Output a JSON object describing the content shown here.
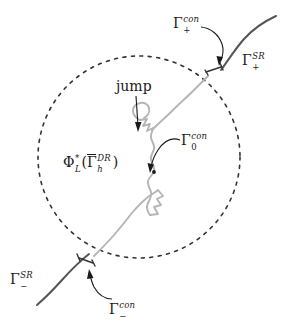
{
  "figure": {
    "kind": "mathematical-diagram",
    "width": 294,
    "height": 326,
    "background_color": "#ffffff"
  },
  "colors": {
    "ink": "#1a1a1a",
    "dashed_circle": "#333333",
    "rough_curve": "#b5b5b5",
    "smooth_curve": "#555555",
    "bracket": "#333333"
  },
  "labels": {
    "jump": {
      "text": "jump",
      "name": "jump-label"
    },
    "phi": {
      "base": "Φ",
      "sup": "*",
      "sub": "L",
      "open_paren": "(",
      "gamma_bar": "Γ",
      "gamma_sup": "DR",
      "gamma_sub": "h",
      "close_paren": ")",
      "plain": "Φ*_L(Γ̄^DR_h)"
    },
    "gamma_0_con": {
      "base": "Γ",
      "sup": "con",
      "sub": "0",
      "plain": "Γ_0^con"
    },
    "gamma_plus_con": {
      "base": "Γ",
      "sup": "con",
      "sub": "+",
      "plain": "Γ_+^con"
    },
    "gamma_plus_sr": {
      "base": "Γ",
      "sup": "SR",
      "sub": "+",
      "plain": "Γ_+^SR"
    },
    "gamma_minus_sr": {
      "base": "Γ",
      "sup": "SR",
      "sub": "−",
      "plain": "Γ_-^SR"
    },
    "gamma_minus_con": {
      "base": "Γ",
      "sup": "con",
      "sub": "−",
      "plain": "Γ_-^con"
    }
  },
  "geometry": {
    "circle": {
      "cx": 139,
      "cy": 157,
      "r": 101,
      "dash": "3 5"
    },
    "rough_curve_path": "M 96,258 C 104,250 112,243 118,235 C 124,228 129,221 134,214 C 140,206 145,200 150,196 C 154,193 157,191 158,189 C 159,187 157,186 155,186 C 152,186 150,187 150,189 C 150,192 152,194 155,195 C 158,196 160,195 161,192 C 162,188 160,184 157,181 C 154,178 152,175 152,172 C 152,169 154,166 156,164 C 158,162 159,160 158,158 C 157,156 154,155 152,156 C 150,157 149,159 150,161 C 151,163 153,164 155,163 C 158,162 159,159 158,156 C 156,152 153,149 151,146 C 149,143 148,140 149,137 C 150,134 152,131 153,129 C 154,127 153,125 151,124 C 148,123 145,124 144,127 C 143,130 145,133 148,134 C 151,135 154,133 155,130 C 156,126 154,122 151,119 C 148,116 146,113 147,110 C 148,107 150,105 152,104 C 154,103 155,101 154,99 C 153,97 150,96 147,97 C 144,98 142,101 143,104 C 144,107 147,108 150,107 C 152,106 153,104 152,102",
    "rough_curve_upper_path": "M 156,127 C 162,121 168,116 174,110 C 180,104 186,99 192,94 C 197,89 202,85 206,81 C 209,78 212,75 214,73",
    "smooth_curve_plus_path": "M 220,70 C 228,60 236,50 244,41 C 252,32 262,25 275,18",
    "smooth_curve_minus_path": "M 90,255 C 80,262 70,270 60,280 C 50,290 42,298 34,306",
    "bracket_plus": {
      "x1": 207,
      "y1": 72,
      "x2": 222,
      "y2": 66
    },
    "bracket_minus": {
      "x1": 78,
      "y1": 258,
      "x2": 93,
      "y2": 264
    },
    "dot_gamma0": {
      "cx": 154,
      "cy": 172,
      "r": 1.8
    },
    "arrow_jump": {
      "x1": 136,
      "y1": 96,
      "x2": 139,
      "y2": 128
    },
    "arrow_gamma0": {
      "from": [
        180,
        141
      ],
      "to": [
        157,
        169
      ]
    },
    "arrow_gamma_plus_con": {
      "from": [
        203,
        28
      ],
      "to": [
        213,
        62
      ]
    },
    "arrow_gamma_minus_con": {
      "from": [
        110,
        300
      ],
      "to": [
        90,
        268
      ]
    }
  }
}
